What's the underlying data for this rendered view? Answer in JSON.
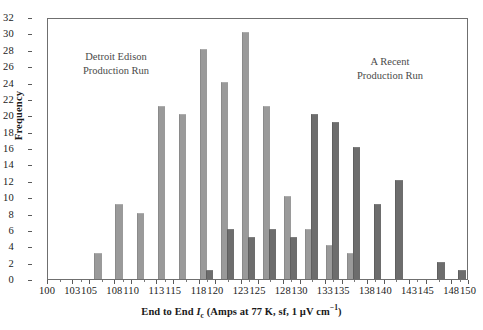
{
  "chart_data": {
    "type": "bar",
    "title": "",
    "xlabel": "End to End Ic (Amps at 77 K, sf, 1 uV cm-1)",
    "ylabel": "Frequency",
    "xlim": [
      100,
      150
    ],
    "ylim": [
      0,
      32
    ],
    "ytick_step": 2,
    "grid": false,
    "legend_position": "annotations-in-plot",
    "xticks": [
      100,
      103,
      105,
      108,
      110,
      113,
      115,
      118,
      120,
      123,
      125,
      128,
      130,
      133,
      135,
      138,
      140,
      143,
      145,
      148,
      150
    ],
    "yticks": [
      0,
      2,
      4,
      6,
      8,
      10,
      12,
      14,
      16,
      18,
      20,
      22,
      24,
      26,
      28,
      30,
      32
    ],
    "bin_centers": [
      101.25,
      103.75,
      106.25,
      108.75,
      111.25,
      113.75,
      116.25,
      118.75,
      121.25,
      123.75,
      126.25,
      128.75,
      131.25,
      133.75,
      136.25,
      138.75,
      141.25,
      143.75,
      146.25,
      148.75
    ],
    "series": [
      {
        "name": "Detroit Edison Production Run",
        "color": "#9a9a9a",
        "values": [
          0,
          0,
          3,
          9,
          8,
          21,
          20,
          28,
          24,
          30,
          21,
          10,
          6,
          4,
          3,
          0,
          0,
          0,
          0,
          0
        ]
      },
      {
        "name": "A Recent Production Run",
        "color": "#6d6d6d",
        "values": [
          0,
          0,
          0,
          0,
          0,
          0,
          0,
          1,
          6,
          5,
          6,
          5,
          20,
          19,
          16,
          9,
          12,
          0,
          2,
          1
        ]
      }
    ],
    "annotations": [
      {
        "id": "left",
        "line1": "Detroit Edison",
        "line2": "Production Run"
      },
      {
        "id": "right",
        "line1": "A Recent",
        "line2": "Production Run"
      }
    ]
  },
  "axis": {
    "y_title": "Frequency",
    "x_title_parts": {
      "lead": "End to End ",
      "symbol": "I",
      "symbol_sub": "c",
      "rest": " (Amps at 77 K, sf, 1 µV cm",
      "exp": "−1",
      "close": ")"
    }
  }
}
